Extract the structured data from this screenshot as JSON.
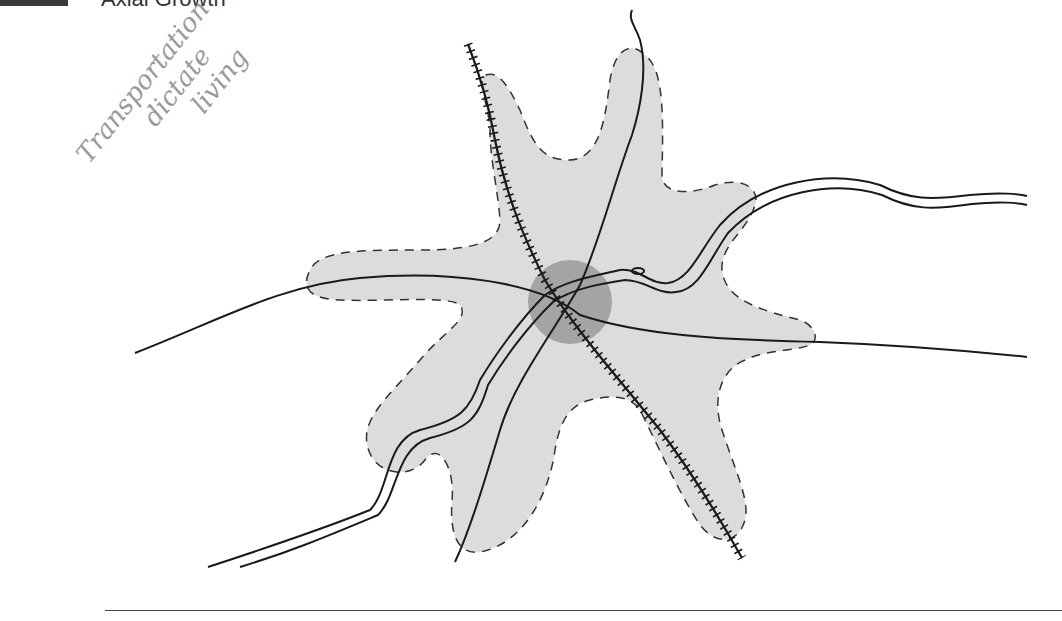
{
  "header": {
    "title": "Axial Growth"
  },
  "annotation": {
    "lines": [
      "Transportation",
      "dictate",
      "living"
    ]
  },
  "diagram": {
    "fill_color": "#dcdcdc",
    "center_color": "#9a9a9a",
    "line_color": "#1a1a1a",
    "outline_style": "dashed",
    "elements": [
      "urban-area",
      "city-center",
      "railroad",
      "highway",
      "roads"
    ]
  }
}
